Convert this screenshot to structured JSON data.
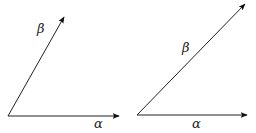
{
  "diagrams": [
    {
      "name": "left",
      "origin": [
        8,
        116
      ],
      "vectors": [
        {
          "label": "α",
          "tip": [
            119,
            116
          ],
          "label_pos": [
            94,
            128
          ]
        },
        {
          "label": "β",
          "tip": [
            64,
            17
          ],
          "label_pos": [
            37,
            33
          ]
        }
      ]
    },
    {
      "name": "right",
      "origin": [
        137,
        115
      ],
      "vectors": [
        {
          "label": "α",
          "tip": [
            247,
            115
          ],
          "label_pos": [
            192,
            128
          ]
        },
        {
          "label": "β",
          "tip": [
            245,
            4
          ],
          "label_pos": [
            182,
            52
          ]
        }
      ]
    }
  ],
  "colors": {
    "stroke": "#222222",
    "background": "#ffffff"
  }
}
